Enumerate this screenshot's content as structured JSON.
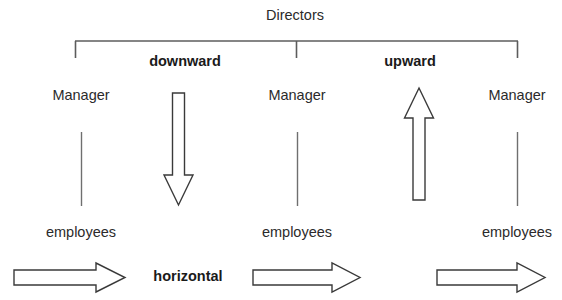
{
  "diagram": {
    "title": "Directors",
    "flow_labels": {
      "downward": "downward",
      "upward": "upward",
      "horizontal": "horizontal"
    },
    "levels": {
      "top": "Directors",
      "middle": "Manager",
      "bottom": "employees"
    },
    "managers": [
      {
        "label": "Manager"
      },
      {
        "label": "Manager"
      },
      {
        "label": "Manager"
      }
    ],
    "employees": [
      {
        "label": "employees"
      },
      {
        "label": "employees"
      },
      {
        "label": "employees"
      }
    ],
    "colors": {
      "background": "#ffffff",
      "text": "#2b2b2b",
      "bold_text": "#1a1a1a",
      "line": "#6f6f6f",
      "bracket": "#5c5c5c",
      "arrow_outline": "#3a3a3a",
      "arrow_fill": "#ffffff"
    }
  }
}
